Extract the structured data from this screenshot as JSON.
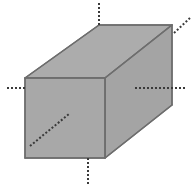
{
  "figure": {
    "title": "Rectangular prism with dotted axis lines",
    "canvas": {
      "width": 194,
      "height": 188,
      "background": "#ffffff"
    },
    "colors": {
      "face_fill": "#a8a8a8",
      "top_face_fill": "#acacac",
      "side_face_fill": "#a4a4a4",
      "edge_stroke": "#6e6e6e",
      "dotted_stroke": "#3a3a3a"
    },
    "solid": {
      "name": "rectangular-prism",
      "front_face": [
        [
          25,
          78
        ],
        [
          105,
          78
        ],
        [
          105,
          158
        ],
        [
          25,
          158
        ]
      ],
      "top_face": [
        [
          25,
          78
        ],
        [
          99,
          25
        ],
        [
          172,
          25
        ],
        [
          105,
          78
        ]
      ],
      "right_face": [
        [
          105,
          78
        ],
        [
          172,
          25
        ],
        [
          172,
          105
        ],
        [
          105,
          158
        ]
      ],
      "edges": [
        {
          "name": "front-top-edge",
          "from": [
            25,
            78
          ],
          "to": [
            105,
            78
          ]
        },
        {
          "name": "front-left-edge",
          "from": [
            25,
            78
          ],
          "to": [
            25,
            158
          ]
        },
        {
          "name": "front-bottom-edge",
          "from": [
            25,
            158
          ],
          "to": [
            105,
            158
          ]
        },
        {
          "name": "front-right-edge",
          "from": [
            105,
            78
          ],
          "to": [
            105,
            158
          ]
        },
        {
          "name": "top-left-diagonal-edge",
          "from": [
            25,
            78
          ],
          "to": [
            99,
            25
          ]
        },
        {
          "name": "top-back-edge",
          "from": [
            99,
            25
          ],
          "to": [
            172,
            25
          ]
        },
        {
          "name": "top-right-diagonal-edge",
          "from": [
            105,
            78
          ],
          "to": [
            172,
            25
          ]
        },
        {
          "name": "back-right-vertical-edge",
          "from": [
            172,
            25
          ],
          "to": [
            172,
            105
          ]
        },
        {
          "name": "bottom-right-diagonal-edge",
          "from": [
            105,
            158
          ],
          "to": [
            172,
            105
          ]
        }
      ]
    },
    "dotted_lines": [
      {
        "name": "top-vertical-axis-line",
        "from": [
          99,
          3
        ],
        "to": [
          99,
          25
        ]
      },
      {
        "name": "left-horizontal-axis-line",
        "from": [
          7,
          88
        ],
        "to": [
          25,
          88
        ]
      },
      {
        "name": "right-horizontal-axis-line",
        "from": [
          135,
          88
        ],
        "to": [
          187,
          88
        ]
      },
      {
        "name": "bottom-vertical-axis-line",
        "from": [
          88,
          158
        ],
        "to": [
          88,
          184
        ]
      },
      {
        "name": "upper-right-diagonal-axis-line",
        "from": [
          174,
          33
        ],
        "to": [
          190,
          18
        ]
      },
      {
        "name": "interior-diagonal-axis-line",
        "from": [
          30,
          146
        ],
        "to": [
          69,
          114
        ]
      }
    ],
    "dot_pattern": {
      "dash": 2,
      "gap": 2,
      "width": 2
    }
  }
}
